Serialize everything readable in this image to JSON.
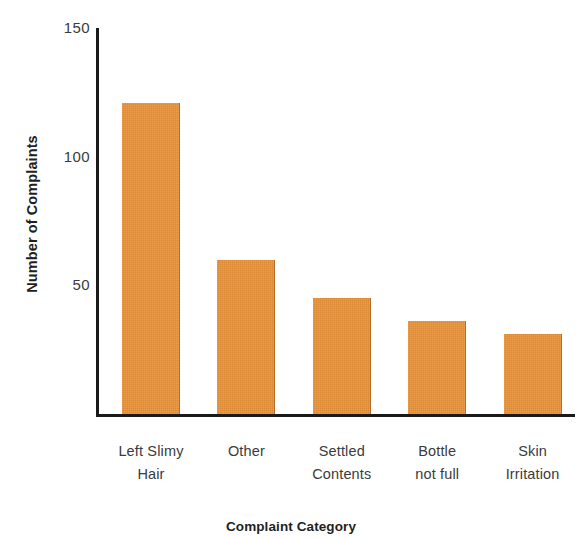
{
  "chart_data": {
    "type": "bar",
    "title": "",
    "subtitle": "",
    "xlabel": "Complaint Category",
    "ylabel": "Number of Complaints",
    "categories": [
      "Left Slimy Hair",
      "Other",
      "Settled Contents",
      "Bottle not full",
      "Skin Irritation"
    ],
    "category_lines": [
      [
        "Left Slimy",
        "Hair"
      ],
      [
        "Other",
        ""
      ],
      [
        "Settled",
        "Contents"
      ],
      [
        "Bottle",
        "not full"
      ],
      [
        "Skin",
        "Irritation"
      ]
    ],
    "values": [
      121,
      60,
      45,
      36,
      31
    ],
    "ylim": [
      0,
      150
    ],
    "yticks": [
      150,
      100,
      50
    ],
    "ytick_labels": [
      "150",
      "100",
      "50"
    ],
    "grid": false,
    "legend": false,
    "legend_position": "none",
    "bar_color": "#e89139",
    "axis_color": "#1a1a1a",
    "text_color": "#231f20",
    "background_color": "#ffffff"
  },
  "axis": {
    "y_title": "Number of Complaints",
    "x_title": "Complaint Category",
    "ytick_0": "150",
    "ytick_1": "100",
    "ytick_2": "50"
  },
  "bars": [
    {
      "label_line1": "Left Slimy",
      "label_line2": "Hair",
      "value": 121
    },
    {
      "label_line1": "Other",
      "label_line2": "",
      "value": 60
    },
    {
      "label_line1": "Settled",
      "label_line2": "Contents",
      "value": 45
    },
    {
      "label_line1": "Bottle",
      "label_line2": "not full",
      "value": 36
    },
    {
      "label_line1": "Skin",
      "label_line2": "Irritation",
      "value": 31
    }
  ]
}
